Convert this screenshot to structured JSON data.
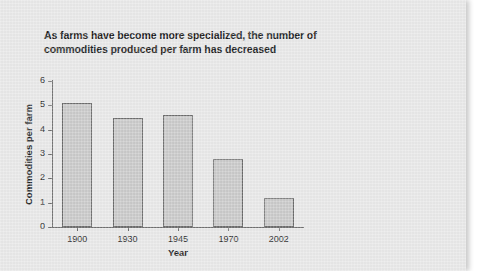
{
  "page": {
    "background_color": "#e8e8e8"
  },
  "chart_data": {
    "type": "bar",
    "title": "As farms have become more specialized, the number of commodities produced per farm has decreased",
    "title_lines": [
      "As farms have become more specialized, the number of",
      "commodities produced per farm has decreased"
    ],
    "categories": [
      "1900",
      "1930",
      "1945",
      "1970",
      "2002"
    ],
    "values": [
      5.1,
      4.5,
      4.6,
      2.8,
      1.2
    ],
    "xlabel": "Year",
    "ylabel": "Commodities per farm",
    "ylim": [
      0,
      6
    ],
    "ytick_labels": [
      "0",
      "1",
      "2",
      "3",
      "4",
      "5",
      "6"
    ],
    "ytick_values": [
      0,
      1,
      2,
      3,
      4,
      5,
      6
    ],
    "grid": false,
    "legend": false,
    "bar_color": "#c9c9c9",
    "bar_border_color": "#6b6b6b",
    "axis_color": "#6e6e6e"
  }
}
